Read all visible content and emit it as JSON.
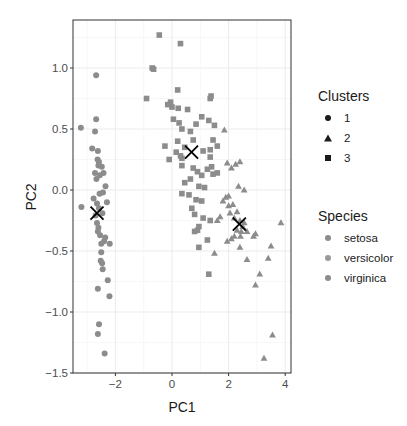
{
  "chart_data": {
    "type": "scatter",
    "title": "",
    "xlabel": "PC1",
    "ylabel": "PC2",
    "xlim": [
      -3.4,
      4.3
    ],
    "ylim": [
      -1.5,
      1.4
    ],
    "xticks": [
      -2,
      0,
      2,
      4
    ],
    "xtick_labels": [
      "-2",
      "0",
      "2",
      "4"
    ],
    "yticks": [
      -1.5,
      -1.0,
      -0.5,
      0.0,
      0.5,
      1.0
    ],
    "ytick_labels": [
      "-1.5",
      "-1.0",
      "-0.5",
      "0.0",
      "0.5",
      "1.0"
    ],
    "grid": true,
    "legend_position": "right",
    "point_color": "#8c8c8c",
    "centroid_marker": "X",
    "centroids": [
      {
        "cluster": "1",
        "x": -2.65,
        "y": -0.19
      },
      {
        "cluster": "2",
        "x": 2.38,
        "y": -0.28
      },
      {
        "cluster": "3",
        "x": 0.69,
        "y": 0.31
      }
    ],
    "legends": [
      {
        "title": "Clusters",
        "entries": [
          {
            "label": "1",
            "shape": "circle"
          },
          {
            "label": "2",
            "shape": "triangle"
          },
          {
            "label": "3",
            "shape": "square"
          }
        ]
      },
      {
        "title": "Species",
        "entries": [
          {
            "label": "setosa",
            "shape": "circle"
          },
          {
            "label": "versicolor",
            "shape": "circle"
          },
          {
            "label": "virginica",
            "shape": "circle"
          }
        ]
      }
    ],
    "series": [
      {
        "name": "Cluster 1",
        "shape": "circle",
        "points": [
          [
            -2.68,
            0.94
          ],
          [
            -2.68,
            0.58
          ],
          [
            -3.22,
            0.51
          ],
          [
            -2.72,
            0.48
          ],
          [
            -2.82,
            0.34
          ],
          [
            -2.62,
            0.32
          ],
          [
            -2.63,
            0.25
          ],
          [
            -2.58,
            0.23
          ],
          [
            -2.6,
            0.2
          ],
          [
            -2.48,
            0.19
          ],
          [
            -2.72,
            0.14
          ],
          [
            -2.42,
            0.14
          ],
          [
            -2.55,
            0.12
          ],
          [
            -2.67,
            0.09
          ],
          [
            -2.35,
            0.03
          ],
          [
            -2.56,
            -0.03
          ],
          [
            -2.44,
            -0.02
          ],
          [
            -2.3,
            -0.1
          ],
          [
            -2.77,
            -0.07
          ],
          [
            -2.65,
            -0.11
          ],
          [
            -2.58,
            -0.15
          ],
          [
            -2.46,
            -0.19
          ],
          [
            -3.2,
            -0.14
          ],
          [
            -2.7,
            -0.21
          ],
          [
            -2.65,
            -0.27
          ],
          [
            -2.6,
            -0.31
          ],
          [
            -2.62,
            -0.34
          ],
          [
            -2.54,
            -0.37
          ],
          [
            -2.36,
            -0.39
          ],
          [
            -2.4,
            -0.42
          ],
          [
            -2.2,
            -0.44
          ],
          [
            -2.5,
            -0.44
          ],
          [
            -2.5,
            -0.51
          ],
          [
            -2.52,
            -0.58
          ],
          [
            -2.47,
            -0.6
          ],
          [
            -2.45,
            -0.65
          ],
          [
            -2.27,
            -0.74
          ],
          [
            -2.62,
            -0.81
          ],
          [
            -2.21,
            -0.87
          ],
          [
            -2.58,
            -1.1
          ],
          [
            -2.62,
            -1.18
          ],
          [
            -2.38,
            -1.34
          ]
        ]
      },
      {
        "name": "Cluster 2",
        "shape": "triangle",
        "points": [
          [
            1.85,
            0.49
          ],
          [
            1.95,
            0.22
          ],
          [
            2.1,
            0.18
          ],
          [
            2.25,
            0.21
          ],
          [
            2.4,
            0.23
          ],
          [
            2.35,
            0.03
          ],
          [
            2.55,
            0.0
          ],
          [
            1.9,
            -0.06
          ],
          [
            2.0,
            -0.05
          ],
          [
            1.8,
            -0.09
          ],
          [
            2.0,
            -0.13
          ],
          [
            2.15,
            -0.12
          ],
          [
            2.05,
            -0.19
          ],
          [
            2.3,
            -0.18
          ],
          [
            2.2,
            -0.23
          ],
          [
            1.6,
            -0.25
          ],
          [
            1.7,
            -0.22
          ],
          [
            2.4,
            -0.25
          ],
          [
            2.55,
            -0.27
          ],
          [
            2.5,
            -0.3
          ],
          [
            2.3,
            -0.33
          ],
          [
            2.45,
            -0.34
          ],
          [
            2.65,
            -0.34
          ],
          [
            2.95,
            -0.36
          ],
          [
            2.88,
            -0.38
          ],
          [
            2.2,
            -0.38
          ],
          [
            2.42,
            -0.38
          ],
          [
            2.1,
            -0.4
          ],
          [
            1.95,
            -0.42
          ],
          [
            1.5,
            -0.52
          ],
          [
            2.4,
            -0.47
          ],
          [
            2.65,
            -0.57
          ],
          [
            3.5,
            -0.46
          ],
          [
            3.4,
            -0.56
          ],
          [
            3.85,
            -0.27
          ],
          [
            3.1,
            -0.69
          ],
          [
            2.95,
            -0.78
          ],
          [
            3.55,
            -1.19
          ],
          [
            3.25,
            -1.38
          ]
        ]
      },
      {
        "name": "Cluster 3",
        "shape": "square",
        "points": [
          [
            -0.45,
            1.27
          ],
          [
            0.3,
            1.2
          ],
          [
            -0.65,
            0.99
          ],
          [
            -0.7,
            1.0
          ],
          [
            -0.9,
            0.75
          ],
          [
            0.2,
            0.82
          ],
          [
            0.0,
            0.68
          ],
          [
            -0.15,
            0.7
          ],
          [
            -0.05,
            0.72
          ],
          [
            0.22,
            0.67
          ],
          [
            0.55,
            0.66
          ],
          [
            1.35,
            0.75
          ],
          [
            1.38,
            0.77
          ],
          [
            0.05,
            0.58
          ],
          [
            0.25,
            0.55
          ],
          [
            0.35,
            0.5
          ],
          [
            0.65,
            0.48
          ],
          [
            1.05,
            0.6
          ],
          [
            1.3,
            0.57
          ],
          [
            1.5,
            0.53
          ],
          [
            0.85,
            0.54
          ],
          [
            1.45,
            0.41
          ],
          [
            0.75,
            0.41
          ],
          [
            1.6,
            0.36
          ],
          [
            0.2,
            0.4
          ],
          [
            -0.25,
            0.36
          ],
          [
            0.45,
            0.35
          ],
          [
            0.15,
            0.31
          ],
          [
            0.3,
            0.28
          ],
          [
            0.35,
            0.26
          ],
          [
            1.1,
            0.32
          ],
          [
            1.35,
            0.33
          ],
          [
            1.35,
            0.27
          ],
          [
            -0.1,
            0.25
          ],
          [
            0.35,
            0.2
          ],
          [
            0.75,
            0.18
          ],
          [
            0.9,
            0.15
          ],
          [
            1.05,
            0.12
          ],
          [
            1.25,
            0.17
          ],
          [
            1.4,
            0.19
          ],
          [
            1.6,
            0.14
          ],
          [
            1.45,
            0.13
          ],
          [
            0.65,
            0.09
          ],
          [
            0.45,
            0.06
          ],
          [
            0.95,
            0.03
          ],
          [
            1.15,
            0.02
          ],
          [
            0.35,
            -0.03
          ],
          [
            0.6,
            -0.04
          ],
          [
            0.85,
            -0.08
          ],
          [
            1.05,
            -0.09
          ],
          [
            0.7,
            -0.15
          ],
          [
            0.8,
            -0.2
          ],
          [
            1.1,
            -0.23
          ],
          [
            0.95,
            -0.3
          ],
          [
            1.35,
            -0.25
          ],
          [
            0.9,
            -0.33
          ],
          [
            1.25,
            -0.41
          ],
          [
            0.95,
            -0.47
          ],
          [
            1.3,
            -0.69
          ],
          [
            0.8,
            -0.34
          ]
        ]
      }
    ]
  },
  "axes": {
    "x_title": "PC1",
    "y_title": "PC2"
  },
  "legend": {
    "clusters_title": "Clusters",
    "clusters": [
      "1",
      "2",
      "3"
    ],
    "species_title": "Species",
    "species": [
      "setosa",
      "versicolor",
      "virginica"
    ]
  }
}
